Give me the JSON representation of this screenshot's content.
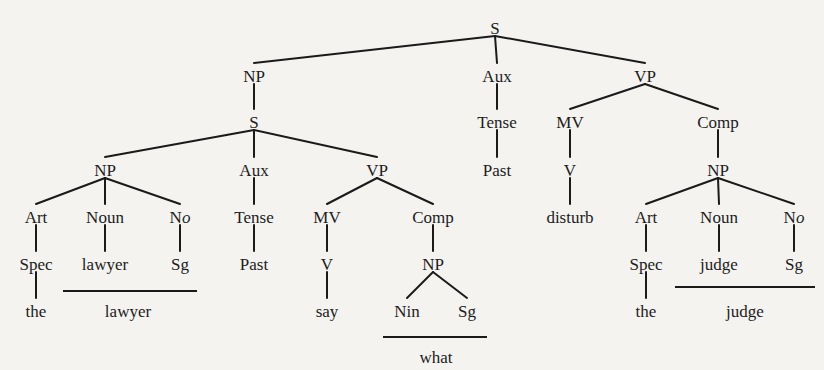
{
  "diagram": {
    "type": "phrase-structure-tree",
    "nodes": [
      {
        "id": "S_root",
        "label": "S",
        "x": 495,
        "y": 28
      },
      {
        "id": "NP_1",
        "label": "NP",
        "x": 254,
        "y": 76
      },
      {
        "id": "Aux_1",
        "label": "Aux",
        "x": 497,
        "y": 76
      },
      {
        "id": "VP_1",
        "label": "VP",
        "x": 645,
        "y": 76
      },
      {
        "id": "S_2",
        "label": "S",
        "x": 254,
        "y": 122
      },
      {
        "id": "Tense_1",
        "label": "Tense",
        "x": 497,
        "y": 122
      },
      {
        "id": "MV_1",
        "label": "MV",
        "x": 570,
        "y": 122
      },
      {
        "id": "Comp_1",
        "label": "Comp",
        "x": 718,
        "y": 122
      },
      {
        "id": "Past_1",
        "label": "Past",
        "x": 497,
        "y": 170
      },
      {
        "id": "V_1",
        "label": "V",
        "x": 570,
        "y": 170
      },
      {
        "id": "NP_4",
        "label": "NP",
        "x": 718,
        "y": 170
      },
      {
        "id": "NP_2",
        "label": "NP",
        "x": 105,
        "y": 170
      },
      {
        "id": "Aux_2",
        "label": "Aux",
        "x": 254,
        "y": 170
      },
      {
        "id": "VP_2",
        "label": "VP",
        "x": 377,
        "y": 170
      },
      {
        "id": "disturb",
        "label": "disturb",
        "x": 570,
        "y": 217
      },
      {
        "id": "Art_2",
        "label": "Art",
        "x": 646,
        "y": 217
      },
      {
        "id": "Noun_2",
        "label": "Noun",
        "x": 719,
        "y": 217
      },
      {
        "id": "No_2",
        "label": "No",
        "x": 794,
        "y": 217,
        "italic_o": true
      },
      {
        "id": "Art_1",
        "label": "Art",
        "x": 36,
        "y": 217
      },
      {
        "id": "Noun_1",
        "label": "Noun",
        "x": 105,
        "y": 217
      },
      {
        "id": "No_1",
        "label": "No",
        "x": 180,
        "y": 217,
        "italic_o": true
      },
      {
        "id": "Tense_2",
        "label": "Tense",
        "x": 254,
        "y": 217
      },
      {
        "id": "MV_2",
        "label": "MV",
        "x": 327,
        "y": 217
      },
      {
        "id": "Comp_2",
        "label": "Comp",
        "x": 433,
        "y": 217
      },
      {
        "id": "Spec_1",
        "label": "Spec",
        "x": 36,
        "y": 264
      },
      {
        "id": "lawyer_1",
        "label": "lawyer",
        "x": 105,
        "y": 264
      },
      {
        "id": "Sg_1",
        "label": "Sg",
        "x": 180,
        "y": 264
      },
      {
        "id": "Past_2",
        "label": "Past",
        "x": 254,
        "y": 264
      },
      {
        "id": "V_2",
        "label": "V",
        "x": 327,
        "y": 264
      },
      {
        "id": "NP_3",
        "label": "NP",
        "x": 433,
        "y": 264
      },
      {
        "id": "Spec_2",
        "label": "Spec",
        "x": 646,
        "y": 264
      },
      {
        "id": "judge_1",
        "label": "judge",
        "x": 719,
        "y": 264
      },
      {
        "id": "Sg_3",
        "label": "Sg",
        "x": 794,
        "y": 264
      },
      {
        "id": "the_1",
        "label": "the",
        "x": 36,
        "y": 311
      },
      {
        "id": "say",
        "label": "say",
        "x": 327,
        "y": 311
      },
      {
        "id": "Nin",
        "label": "Nin",
        "x": 407,
        "y": 311
      },
      {
        "id": "Sg_2",
        "label": "Sg",
        "x": 467,
        "y": 311
      },
      {
        "id": "the_2",
        "label": "the",
        "x": 646,
        "y": 311
      }
    ],
    "edges": [
      [
        "S_root",
        "NP_1"
      ],
      [
        "S_root",
        "Aux_1"
      ],
      [
        "S_root",
        "VP_1"
      ],
      [
        "NP_1",
        "S_2"
      ],
      [
        "Aux_1",
        "Tense_1"
      ],
      [
        "Tense_1",
        "Past_1"
      ],
      [
        "VP_1",
        "MV_1"
      ],
      [
        "VP_1",
        "Comp_1"
      ],
      [
        "MV_1",
        "V_1"
      ],
      [
        "V_1",
        "disturb"
      ],
      [
        "Comp_1",
        "NP_4"
      ],
      [
        "NP_4",
        "Art_2"
      ],
      [
        "NP_4",
        "Noun_2"
      ],
      [
        "NP_4",
        "No_2"
      ],
      [
        "Art_2",
        "Spec_2"
      ],
      [
        "Noun_2",
        "judge_1"
      ],
      [
        "No_2",
        "Sg_3"
      ],
      [
        "Spec_2",
        "the_2"
      ],
      [
        "S_2",
        "NP_2"
      ],
      [
        "S_2",
        "Aux_2"
      ],
      [
        "S_2",
        "VP_2"
      ],
      [
        "NP_2",
        "Art_1"
      ],
      [
        "NP_2",
        "Noun_1"
      ],
      [
        "NP_2",
        "No_1"
      ],
      [
        "Art_1",
        "Spec_1"
      ],
      [
        "Noun_1",
        "lawyer_1"
      ],
      [
        "No_1",
        "Sg_1"
      ],
      [
        "Spec_1",
        "the_1"
      ],
      [
        "Aux_2",
        "Tense_2"
      ],
      [
        "Tense_2",
        "Past_2"
      ],
      [
        "VP_2",
        "MV_2"
      ],
      [
        "VP_2",
        "Comp_2"
      ],
      [
        "MV_2",
        "V_2"
      ],
      [
        "V_2",
        "say"
      ],
      [
        "Comp_2",
        "NP_3"
      ],
      [
        "NP_3",
        "Nin"
      ],
      [
        "NP_3",
        "Sg_2"
      ]
    ],
    "surface_forms": [
      {
        "id": "surface_lawyer",
        "label": "lawyer",
        "line_x1": 63,
        "line_x2": 197,
        "line_y": 291,
        "text_x": 128,
        "text_y": 311
      },
      {
        "id": "surface_what",
        "label": "what",
        "line_x1": 383,
        "line_x2": 487,
        "line_y": 337,
        "text_x": 436,
        "text_y": 357
      },
      {
        "id": "surface_judge",
        "label": "judge",
        "line_x1": 675,
        "line_x2": 815,
        "line_y": 287,
        "text_x": 745,
        "text_y": 311
      }
    ]
  }
}
